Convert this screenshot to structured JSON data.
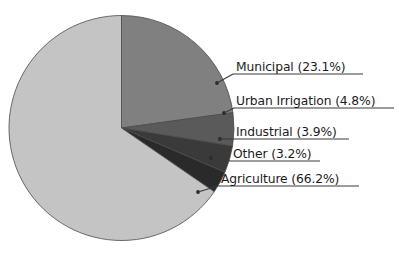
{
  "chart_data": {
    "type": "pie",
    "title": "",
    "subtitle": "",
    "xlabel": "",
    "ylabel": "",
    "grid": false,
    "legend_position": "callout-labels-right",
    "start_angle_deg": 0,
    "direction": "clockwise",
    "categories": [
      "Municipal",
      "Urban Irrigation",
      "Industrial",
      "Other",
      "Agriculture"
    ],
    "values": [
      23.1,
      4.8,
      3.9,
      3.2,
      66.2
    ],
    "units": "percent",
    "slices": [
      {
        "label": "Municipal",
        "value": 23.1,
        "value_text": "23.1%",
        "callout": "Municipal (23.1%)",
        "color": "#808080"
      },
      {
        "label": "Urban Irrigation",
        "value": 4.8,
        "value_text": "4.8%",
        "callout": "Urban Irrigation (4.8%)",
        "color": "#5a5a5a"
      },
      {
        "label": "Industrial",
        "value": 3.9,
        "value_text": "3.9%",
        "callout": "Industrial (3.9%)",
        "color": "#3a3a3a"
      },
      {
        "label": "Other",
        "value": 3.2,
        "value_text": "3.2%",
        "callout": "Other (3.2%)",
        "color": "#2a2a2a"
      },
      {
        "label": "Agriculture",
        "value": 66.2,
        "value_text": "66.2%",
        "callout": "Agriculture (66.2%)",
        "color": "#c4c4c4"
      }
    ]
  },
  "figure": {
    "background_color": "#ffffff",
    "outline_color": "#4a4a4a",
    "label_color": "#1c1c1c"
  }
}
